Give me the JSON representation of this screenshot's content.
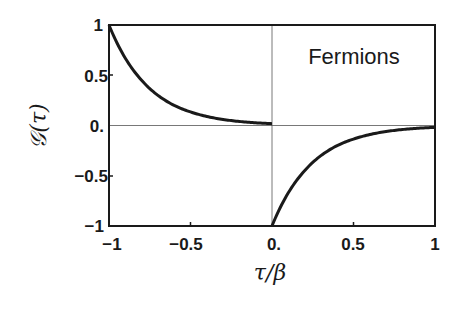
{
  "chart_data": {
    "type": "line",
    "title": "",
    "annotation": "Fermions",
    "xlabel": "τ/β",
    "ylabel": "𝒢(τ)",
    "xlim": [
      -1,
      1
    ],
    "ylim": [
      -1,
      1
    ],
    "xticks": [
      -1,
      -0.5,
      0,
      0.5,
      1
    ],
    "xtick_labels": [
      "−1",
      "−0.5",
      "0.",
      "0.5",
      "1"
    ],
    "yticks": [
      1,
      0.5,
      0,
      -0.5,
      -1
    ],
    "ytick_labels": [
      "1",
      "0.5",
      "0.",
      "−0.5",
      "−1"
    ],
    "grid": false,
    "reference_lines": {
      "x": 0,
      "y": 0
    },
    "series": [
      {
        "name": "G(τ) for τ<0",
        "x": [
          -1,
          -0.9,
          -0.8,
          -0.7,
          -0.6,
          -0.5,
          -0.4,
          -0.3,
          -0.2,
          -0.1,
          0
        ],
        "values": [
          1.0,
          0.67,
          0.45,
          0.3,
          0.2,
          0.135,
          0.09,
          0.06,
          0.04,
          0.027,
          0.018
        ]
      },
      {
        "name": "G(τ) for τ>0",
        "x": [
          0,
          0.1,
          0.2,
          0.3,
          0.4,
          0.5,
          0.6,
          0.7,
          0.8,
          0.9,
          1
        ],
        "values": [
          -1.0,
          -0.67,
          -0.45,
          -0.3,
          -0.2,
          -0.135,
          -0.09,
          -0.06,
          -0.04,
          -0.027,
          -0.018
        ]
      }
    ]
  }
}
